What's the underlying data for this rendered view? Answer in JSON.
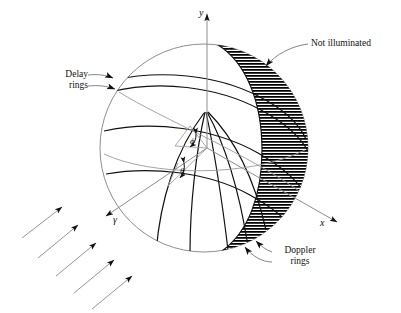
{
  "figure": {
    "domain": "scientific-diagram",
    "title_visible": false,
    "background_color": "#ffffff",
    "ink_color": "#000000",
    "light_ink_color": "#8a8a8a"
  },
  "axes": {
    "y_label": "y",
    "x_label": "x",
    "third_label": "γ"
  },
  "angles": {
    "phi_label": "ϕ",
    "theta_label": "θ"
  },
  "annotations": {
    "not_illuminated": "Not illuminated",
    "delay_rings_line1": "Delay",
    "delay_rings_line2": "rings",
    "doppler_rings_line1": "Doppler",
    "doppler_rings_line2": "rings"
  },
  "sphere": {
    "center_x": 204,
    "center_y": 148,
    "radius": 104
  },
  "incident_arrows": {
    "count": 5,
    "direction_degrees": 45,
    "description": "parallel incident illumination arrows pointing up-right"
  },
  "rings": {
    "delay_ring_count": 4,
    "doppler_ring_count": 4
  },
  "hatching": {
    "pattern": "horizontal-lines",
    "line_spacing_px": 3,
    "region": "crescent on right limb of sphere"
  }
}
